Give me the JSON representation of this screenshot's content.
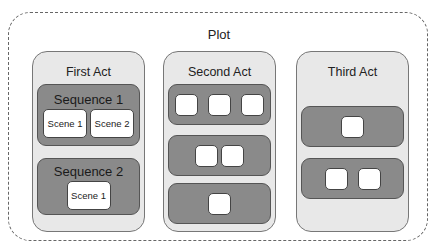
{
  "diagram": {
    "title": "Plot",
    "acts": [
      {
        "title": "First Act",
        "sequences": [
          {
            "title": "Sequence 1",
            "scenes": [
              "Scene 1",
              "Scene 2"
            ]
          },
          {
            "title": "Sequence 2",
            "scenes": [
              "Scene 1"
            ]
          }
        ]
      },
      {
        "title": "Second Act",
        "sequences": [
          {
            "title": "",
            "scenes": [
              "",
              "",
              ""
            ]
          },
          {
            "title": "",
            "scenes": [
              "",
              ""
            ]
          },
          {
            "title": "",
            "scenes": [
              ""
            ]
          }
        ]
      },
      {
        "title": "Third Act",
        "sequences": [
          {
            "title": "",
            "scenes": [
              ""
            ]
          },
          {
            "title": "",
            "scenes": [
              "",
              ""
            ]
          }
        ]
      }
    ]
  },
  "colors": {
    "act_fill": "#e8e8e8",
    "sequence_fill": "#8a8a8a",
    "scene_fill": "#ffffff",
    "border": "#555555"
  }
}
